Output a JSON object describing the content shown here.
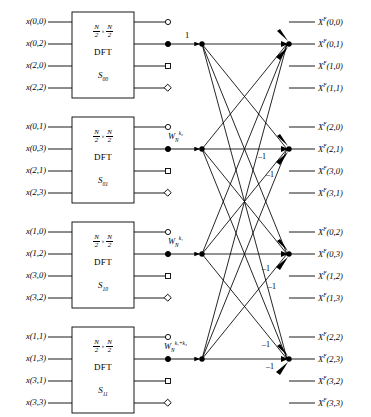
{
  "figure": {
    "type": "signal-flow-diagram",
    "line_color": "#000000",
    "background": "#ffffff"
  },
  "blocks": [
    {
      "id": "S00",
      "size_numerator": "N",
      "size_denominator": "2",
      "times": "×",
      "dft_label": "DFT",
      "sub_label_base": "S",
      "sub_label_sub": "00",
      "inputs": [
        "x(0,0)",
        "x(0,2)",
        "x(2,0)",
        "x(2,2)"
      ],
      "output_markers": [
        "circle",
        "dot",
        "square",
        "diamond"
      ],
      "twiddle": null,
      "twiddle_base": "",
      "twiddle_sub": "",
      "twiddle_sup": "",
      "unity_label": "1"
    },
    {
      "id": "S01",
      "size_numerator": "N",
      "size_denominator": "2",
      "times": "×",
      "dft_label": "DFT",
      "sub_label_base": "S",
      "sub_label_sub": "01",
      "inputs": [
        "x(0,1)",
        "x(0,3)",
        "x(2,1)",
        "x(2,3)"
      ],
      "output_markers": [
        "circle",
        "dot",
        "square",
        "diamond"
      ],
      "twiddle": "W_N^{k2}",
      "twiddle_base": "W",
      "twiddle_sub": "N",
      "twiddle_sup": "k₂",
      "unity_label": ""
    },
    {
      "id": "S10",
      "size_numerator": "N",
      "size_denominator": "2",
      "times": "×",
      "dft_label": "DFT",
      "sub_label_base": "S",
      "sub_label_sub": "10",
      "inputs": [
        "x(1,0)",
        "x(1,2)",
        "x(3,0)",
        "x(3,2)"
      ],
      "output_markers": [
        "circle",
        "dot",
        "square",
        "diamond"
      ],
      "twiddle": "W_N^{k1}",
      "twiddle_base": "W",
      "twiddle_sub": "N",
      "twiddle_sup": "k₁",
      "unity_label": ""
    },
    {
      "id": "S11",
      "size_numerator": "N",
      "size_denominator": "2",
      "times": "×",
      "dft_label": "DFT",
      "sub_label_base": "S",
      "sub_label_sub": "11",
      "inputs": [
        "x(1,1)",
        "x(1,3)",
        "x(3,1)",
        "x(3,3)"
      ],
      "output_markers": [
        "circle",
        "dot",
        "square",
        "diamond"
      ],
      "twiddle": "W_N^{k1+k2}",
      "twiddle_base": "W",
      "twiddle_sub": "N",
      "twiddle_sup": "k₁+k₂",
      "unity_label": ""
    }
  ],
  "output_groups": [
    {
      "group": 1,
      "labels": [
        "Xᶠ(0,0)",
        "Xᶠ(0,1)",
        "Xᶠ(1,0)",
        "Xᶠ(1,1)"
      ],
      "base": "X",
      "sup": "F",
      "indices": [
        "(0,0)",
        "(0,1)",
        "(1,0)",
        "(1,1)"
      ]
    },
    {
      "group": 2,
      "labels": [
        "Xᶠ(2,0)",
        "Xᶠ(2,1)",
        "Xᶠ(3,0)",
        "Xᶠ(3,1)"
      ],
      "base": "X",
      "sup": "F",
      "indices": [
        "(2,0)",
        "(2,1)",
        "(3,0)",
        "(3,1)"
      ]
    },
    {
      "group": 3,
      "labels": [
        "Xᶠ(0,2)",
        "Xᶠ(0,3)",
        "Xᶠ(1,2)",
        "Xᶠ(1,3)"
      ],
      "base": "X",
      "sup": "F",
      "indices": [
        "(0,2)",
        "(0,3)",
        "(1,2)",
        "(1,3)"
      ]
    },
    {
      "group": 4,
      "labels": [
        "Xᶠ(2,2)",
        "Xᶠ(2,3)",
        "Xᶠ(3,2)",
        "Xᶠ(3,3)"
      ],
      "base": "X",
      "sup": "F",
      "indices": [
        "(2,2)",
        "(2,3)",
        "(3,2)",
        "(3,3)"
      ]
    }
  ],
  "annotations": {
    "unity": "1",
    "minus_one": "–1",
    "minus_one_count": 6
  }
}
